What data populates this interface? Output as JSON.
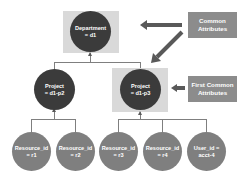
{
  "diagram": {
    "root": {
      "line1": "Department",
      "line2": "= d1",
      "highlighted": true
    },
    "projects": [
      {
        "line1": "Project",
        "line2": "= d1-p2",
        "highlighted": false
      },
      {
        "line1": "Project",
        "line2": "= d1-p3",
        "highlighted": true
      }
    ],
    "leaves": [
      {
        "line1": "Resource_id",
        "line2": "= r1",
        "parent": "d1-p2"
      },
      {
        "line1": "Resource_id",
        "line2": "= r2",
        "parent": "d1-p2"
      },
      {
        "line1": "Resource_id",
        "line2": "= r3",
        "parent": "d1-p3"
      },
      {
        "line1": "Resource_id",
        "line2": "= r4",
        "parent": "d1-p3"
      },
      {
        "line1": "User_id =",
        "line2": "acct-4",
        "parent": "d1-p3"
      }
    ],
    "callouts": [
      {
        "line1": "Common",
        "line2": "Attributes",
        "points_to": [
          "Department = d1",
          "Project = d1-p3"
        ]
      },
      {
        "line1": "First Common",
        "line2": "Attributes",
        "points_to": [
          "Project = d1-p3"
        ]
      }
    ],
    "colors": {
      "highlight_box": "#d9d9d9",
      "dark_node": "#3b3b3b",
      "leaf_node": "#7f7f7f",
      "callout": "#8c8c8c",
      "arrow": "#595959",
      "connector": "#7f7f7f"
    }
  }
}
